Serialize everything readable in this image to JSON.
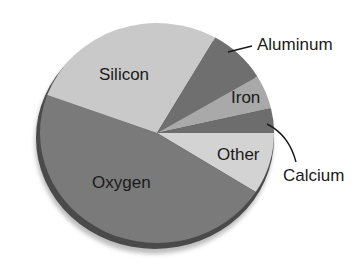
{
  "chart_data": {
    "type": "pie",
    "title": "",
    "categories": [
      "Other",
      "Oxygen",
      "Silicon",
      "Aluminum",
      "Iron",
      "Calcium"
    ],
    "values": [
      9.0,
      46.6,
      27.7,
      8.1,
      5.0,
      3.6
    ],
    "unit": "percent (estimated from slice angles)",
    "start_angle_deg": 0,
    "direction": "clockwise from 3 o'clock",
    "colors": [
      "#d3d3d3",
      "#7a7a7a",
      "#c9c9c9",
      "#6f6f6f",
      "#a9a9a9",
      "#6d6d6d"
    ],
    "labels": [
      {
        "text": "Other",
        "placement": "inside"
      },
      {
        "text": "Oxygen",
        "placement": "inside"
      },
      {
        "text": "Silicon",
        "placement": "inside"
      },
      {
        "text": "Aluminum",
        "placement": "outside with leader line"
      },
      {
        "text": "Iron",
        "placement": "inside"
      },
      {
        "text": "Calcium",
        "placement": "outside with curved leader line"
      }
    ],
    "legend": "none",
    "grid": false
  }
}
